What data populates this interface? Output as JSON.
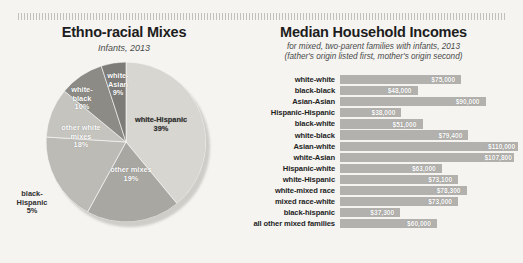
{
  "decoration": {
    "top_rule": "dotted-rule"
  },
  "pie_panel": {
    "title": "Ethno-racial Mixes",
    "subtitle": "Infants, 2013"
  },
  "bar_panel": {
    "title": "Median Household Incomes",
    "subtitle_line1": "for mixed, two-parent families with infants, 2013",
    "subtitle_line2": "(father's origin listed first, mother's origin second)"
  },
  "chart_data": [
    {
      "type": "pie",
      "title": "Ethno-racial Mixes",
      "subtitle": "Infants, 2013",
      "unit": "percent",
      "categories": [
        "white-Hispanic",
        "other mixes",
        "other white mixes",
        "white-black",
        "white-Asian",
        "black-Hispanic"
      ],
      "values": [
        39,
        19,
        18,
        10,
        9,
        5
      ],
      "labels": [
        "white-Hispanic 39%",
        "other mixes 19%",
        "other white mixes 18%",
        "white-black 10%",
        "white-Asian 9%",
        "black-Hispanic 5%"
      ],
      "colors": [
        "#d8d6d1",
        "#a9a7a2",
        "#bdbbb6",
        "#c6c4bf",
        "#8d8b86",
        "#7e7c78"
      ],
      "legend": "none"
    },
    {
      "type": "bar",
      "orientation": "horizontal",
      "title": "Median Household Incomes",
      "subtitle": "for mixed, two-parent families with infants, 2013 (father's origin listed first, mother's origin second)",
      "xlabel": "",
      "ylabel": "",
      "xlim": [
        0,
        110000
      ],
      "grid": false,
      "legend": "none",
      "bar_color": "#b3b1ad",
      "categories": [
        "white-white",
        "black-black",
        "Asian-Asian",
        "Hispanic-Hispanic",
        "black-white",
        "white-black",
        "Asian-white",
        "white-Asian",
        "Hispanic-white",
        "white-Hispanic",
        "white-mixed race",
        "mixed race-white",
        "black-hispanic",
        "all other mixed families"
      ],
      "values": [
        75000,
        48000,
        90000,
        38000,
        51000,
        79400,
        110000,
        107800,
        63000,
        73100,
        78300,
        73000,
        37300,
        60000
      ],
      "value_labels": [
        "$75,000",
        "$48,000",
        "$90,000",
        "$38,000",
        "$51,000",
        "$79,400",
        "$110,000",
        "$107,800",
        "$63,000",
        "$73,100",
        "$78,300",
        "$73,000",
        "$37,300",
        "$60,000"
      ]
    }
  ]
}
